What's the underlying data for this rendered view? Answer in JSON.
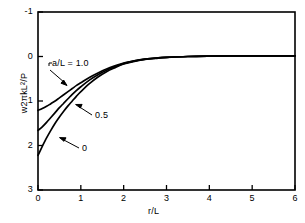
{
  "figure": {
    "background_color": "#ffffff",
    "line_color": "#000000"
  },
  "axes": {
    "x": {
      "label_parts": {
        "numerator": "r",
        "slash": "/",
        "denominator": "L"
      },
      "label": "r/L",
      "ticks": [
        "0",
        "1",
        "2",
        "3",
        "4",
        "5",
        "6"
      ],
      "min": 0,
      "max": 6
    },
    "y": {
      "label": "w2πkL²/P",
      "label_prefix": "w2πkL",
      "label_exponent": "2",
      "label_suffix": "/P",
      "ticks": [
        "-1",
        "0",
        "1",
        "2",
        "3"
      ],
      "min": -1,
      "max": 3,
      "inverted": true
    }
  },
  "annotations": [
    {
      "name": "curve-label-a-over-l-1",
      "text": "a/L = 1.0"
    },
    {
      "name": "curve-label-a-over-l-0point5",
      "text": "0.5"
    },
    {
      "name": "curve-label-a-over-l-0",
      "text": "0"
    }
  ],
  "chart_data": {
    "type": "line",
    "title": "",
    "xlabel": "r/L",
    "ylabel": "w2πkL²/P",
    "xlim": [
      0,
      6
    ],
    "ylim": [
      3,
      -1
    ],
    "y_axis_inverted": true,
    "grid": false,
    "legend_position": "inline-annotations",
    "x": [
      0.0,
      0.1,
      0.2,
      0.3,
      0.4,
      0.5,
      0.6,
      0.7,
      0.8,
      0.9,
      1.0,
      1.2,
      1.4,
      1.6,
      1.8,
      2.0,
      2.25,
      2.5,
      2.75,
      3.0,
      3.5,
      4.0,
      4.5,
      5.0,
      5.5,
      6.0
    ],
    "series": [
      {
        "name": "a/L = 1.0",
        "label": "a/L = 1.0",
        "values": [
          1.21,
          1.17,
          1.12,
          1.06,
          1.0,
          0.93,
          0.86,
          0.79,
          0.72,
          0.65,
          0.59,
          0.47,
          0.37,
          0.28,
          0.21,
          0.15,
          0.1,
          0.06,
          0.035,
          0.02,
          0.0,
          -0.01,
          -0.015,
          -0.015,
          -0.015,
          -0.015
        ]
      },
      {
        "name": "a/L = 0.5",
        "label": "0.5",
        "values": [
          1.66,
          1.58,
          1.48,
          1.37,
          1.26,
          1.15,
          1.05,
          0.95,
          0.85,
          0.76,
          0.68,
          0.53,
          0.41,
          0.31,
          0.23,
          0.16,
          0.1,
          0.06,
          0.035,
          0.02,
          0.0,
          -0.01,
          -0.015,
          -0.015,
          -0.015,
          -0.015
        ]
      },
      {
        "name": "a/L = 0",
        "label": "0",
        "values": [
          2.22,
          2.02,
          1.83,
          1.66,
          1.5,
          1.36,
          1.23,
          1.11,
          1.0,
          0.89,
          0.79,
          0.61,
          0.46,
          0.34,
          0.25,
          0.17,
          0.11,
          0.065,
          0.04,
          0.02,
          0.0,
          -0.01,
          -0.015,
          -0.015,
          -0.015,
          -0.015
        ]
      }
    ]
  }
}
